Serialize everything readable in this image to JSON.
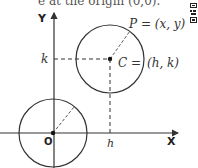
{
  "caption": {
    "text": "e at the origin (0,0)."
  },
  "diagram": {
    "axis_labels": {
      "x": "X",
      "y": "Y"
    },
    "origin_label": "O",
    "point_p_label": "P = (x, y)",
    "center_label_c": "C =",
    "center_label_coords": "(h, k)",
    "tick_h": "h",
    "tick_k": "k",
    "origin": [
      53,
      133
    ],
    "center": [
      110,
      59
    ],
    "radius": 34,
    "stroke_color": "#333333"
  }
}
